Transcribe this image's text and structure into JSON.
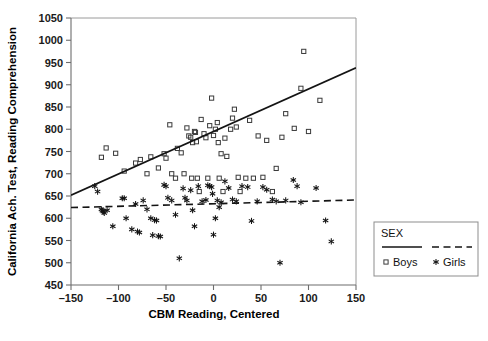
{
  "chart_data": {
    "type": "scatter",
    "title": "",
    "xlabel": "CBM Reading, Centered",
    "ylabel": "California Ach. Test, Reading Comprehension",
    "xlim": [
      -150,
      150
    ],
    "ylim": [
      450,
      1050
    ],
    "xticks": [
      -150,
      -100,
      -50,
      0,
      50,
      100,
      150
    ],
    "yticks": [
      450,
      500,
      550,
      600,
      650,
      700,
      750,
      800,
      850,
      900,
      950,
      1000,
      1050
    ],
    "xticklabels": [
      "–150",
      "–100",
      "–50",
      "0",
      "50",
      "100",
      "150"
    ],
    "yticklabels": [
      "450",
      "500",
      "550",
      "600",
      "650",
      "700",
      "750",
      "800",
      "850",
      "900",
      "950",
      "1000",
      "1050"
    ],
    "grid": false,
    "legend": {
      "position": "right-outside-lower",
      "title": "SEX",
      "entries": [
        {
          "name": "Boys",
          "marker": "open-square",
          "line": "solid",
          "color": "#141414"
        },
        {
          "name": "Girls",
          "marker": "asterisk",
          "line": "dashed",
          "color": "#141414"
        }
      ]
    },
    "series": [
      {
        "name": "Boys",
        "marker": "open-square",
        "fit_line": {
          "style": "solid",
          "x_start": -150,
          "y_start": 652,
          "x_end": 150,
          "y_end": 938
        },
        "points": [
          [
            -118,
            737
          ],
          [
            -113,
            758
          ],
          [
            -103,
            746
          ],
          [
            -94,
            706
          ],
          [
            -82,
            724
          ],
          [
            -77,
            732
          ],
          [
            -70,
            700
          ],
          [
            -66,
            738
          ],
          [
            -58,
            713
          ],
          [
            -52,
            745
          ],
          [
            -50,
            735
          ],
          [
            -46,
            810
          ],
          [
            -44,
            700
          ],
          [
            -40,
            690
          ],
          [
            -38,
            757
          ],
          [
            -34,
            747
          ],
          [
            -31,
            700
          ],
          [
            -28,
            803
          ],
          [
            -26,
            785
          ],
          [
            -24,
            782
          ],
          [
            -23,
            690
          ],
          [
            -22,
            770
          ],
          [
            -20,
            795
          ],
          [
            -19,
            793
          ],
          [
            -18,
            772
          ],
          [
            -17,
            690
          ],
          [
            -15,
            660
          ],
          [
            -13,
            822
          ],
          [
            -10,
            790
          ],
          [
            -8,
            781
          ],
          [
            -6,
            690
          ],
          [
            -4,
            808
          ],
          [
            -2,
            870
          ],
          [
            0,
            786
          ],
          [
            2,
            800
          ],
          [
            4,
            815
          ],
          [
            5,
            770
          ],
          [
            6,
            690
          ],
          [
            8,
            745
          ],
          [
            10,
            660
          ],
          [
            12,
            780
          ],
          [
            14,
            739
          ],
          [
            18,
            800
          ],
          [
            20,
            825
          ],
          [
            22,
            845
          ],
          [
            24,
            805
          ],
          [
            26,
            692
          ],
          [
            28,
            660
          ],
          [
            34,
            690
          ],
          [
            38,
            820
          ],
          [
            42,
            690
          ],
          [
            47,
            785
          ],
          [
            52,
            692
          ],
          [
            56,
            775
          ],
          [
            62,
            660
          ],
          [
            66,
            712
          ],
          [
            72,
            782
          ],
          [
            76,
            835
          ],
          [
            85,
            802
          ],
          [
            92,
            892
          ],
          [
            95,
            975
          ],
          [
            100,
            795
          ],
          [
            112,
            865
          ]
        ]
      },
      {
        "name": "Girls",
        "marker": "asterisk",
        "fit_line": {
          "style": "dashed",
          "x_start": -150,
          "y_start": 624,
          "x_end": 150,
          "y_end": 641
        },
        "points": [
          [
            -125,
            672
          ],
          [
            -122,
            660
          ],
          [
            -118,
            620
          ],
          [
            -117,
            617
          ],
          [
            -116,
            615
          ],
          [
            -115,
            612
          ],
          [
            -112,
            618
          ],
          [
            -106,
            582
          ],
          [
            -96,
            645
          ],
          [
            -94,
            645
          ],
          [
            -92,
            600
          ],
          [
            -86,
            575
          ],
          [
            -82,
            632
          ],
          [
            -80,
            570
          ],
          [
            -78,
            568
          ],
          [
            -74,
            640
          ],
          [
            -70,
            620
          ],
          [
            -66,
            600
          ],
          [
            -64,
            562
          ],
          [
            -62,
            596
          ],
          [
            -60,
            595
          ],
          [
            -58,
            560
          ],
          [
            -56,
            559
          ],
          [
            -52,
            675
          ],
          [
            -50,
            672
          ],
          [
            -48,
            646
          ],
          [
            -44,
            640
          ],
          [
            -40,
            608
          ],
          [
            -36,
            510
          ],
          [
            -32,
            667
          ],
          [
            -30,
            646
          ],
          [
            -28,
            640
          ],
          [
            -24,
            663
          ],
          [
            -22,
            618
          ],
          [
            -20,
            582
          ],
          [
            -16,
            672
          ],
          [
            -12,
            638
          ],
          [
            -8,
            641
          ],
          [
            -6,
            674
          ],
          [
            -4,
            672
          ],
          [
            -2,
            670
          ],
          [
            -1,
            655
          ],
          [
            0,
            563
          ],
          [
            2,
            600
          ],
          [
            4,
            640
          ],
          [
            6,
            625
          ],
          [
            8,
            636
          ],
          [
            12,
            683
          ],
          [
            16,
            668
          ],
          [
            20,
            642
          ],
          [
            24,
            638
          ],
          [
            30,
            672
          ],
          [
            36,
            670
          ],
          [
            40,
            594
          ],
          [
            46,
            638
          ],
          [
            52,
            670
          ],
          [
            56,
            664
          ],
          [
            62,
            642
          ],
          [
            66,
            638
          ],
          [
            70,
            500
          ],
          [
            76,
            640
          ],
          [
            84,
            686
          ],
          [
            88,
            672
          ],
          [
            92,
            636
          ],
          [
            108,
            668
          ],
          [
            118,
            595
          ],
          [
            124,
            548
          ]
        ]
      }
    ]
  },
  "bleed_text": {
    "line": "                                                                                                  "
  }
}
